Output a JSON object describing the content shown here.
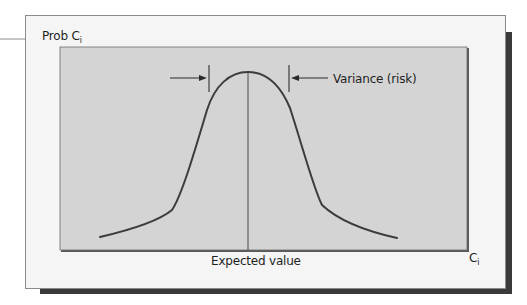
{
  "figure": {
    "type": "normal-distribution-diagram",
    "y_axis_label": {
      "text": "Prob C",
      "subscript": "i"
    },
    "x_axis_label": {
      "text": "C",
      "subscript": "i"
    },
    "annotations": {
      "center_line_label": "Expected value",
      "spread_label": "Variance (risk)"
    },
    "colors": {
      "page_background": "#ffffff",
      "frame_background": "#f5f5f5",
      "frame_border": "#8a8a8a",
      "plot_background": "#d4d4d4",
      "plot_border": "#5a5a5a",
      "shadow": "#3a3a3a",
      "curve": "#3c3c3c",
      "text": "#1f1f1f"
    }
  }
}
